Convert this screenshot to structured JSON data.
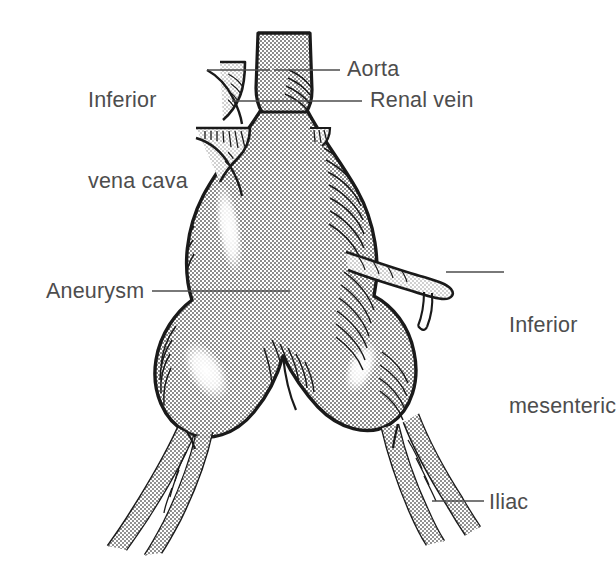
{
  "figure": {
    "type": "medical line-art illustration",
    "background_color": "#ffffff",
    "ink_color": "#1a1a1a",
    "label_color": "#4d4d4d",
    "stipple_fill": "halftone dot screen"
  },
  "labels": {
    "inferior_vena_cava": {
      "line1": "Inferior",
      "line2": "vena cava"
    },
    "aorta": "Aorta",
    "renal_vein": "Renal vein",
    "inferior_mesenteric": {
      "line1": "Inferior",
      "line2": "mesenteric"
    },
    "aneurysm": "Aneurysm",
    "iliac": "Iliac"
  },
  "structures": [
    {
      "name": "aorta-stump",
      "label": "Aorta"
    },
    {
      "name": "inferior-vena-cava",
      "label": "Inferior vena cava"
    },
    {
      "name": "renal-vein",
      "label": "Renal vein"
    },
    {
      "name": "aneurysm-sac",
      "label": "Aneurysm"
    },
    {
      "name": "inferior-mesenteric-artery",
      "label": "Inferior mesenteric"
    },
    {
      "name": "left-iliac-artery",
      "label": "Iliac"
    },
    {
      "name": "right-iliac-artery",
      "label": "Iliac"
    }
  ]
}
